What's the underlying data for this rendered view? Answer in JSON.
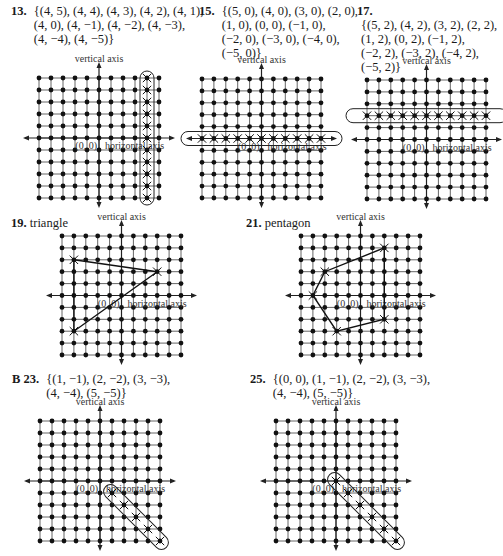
{
  "page": {
    "grid": {
      "min": -5,
      "max": 5,
      "origin_label": "(0, 0)",
      "x_axis_label": "horizontal axis",
      "y_axis_label": "vertical axis"
    },
    "problems": [
      {
        "id": "13",
        "prefix": "",
        "number": "13.",
        "lines": [
          "{(4, 5), (4, 4), (4, 3), (4, 2), (4, 1),",
          "(4, 0), (4, −1), (4, −2), (4, −3),",
          "(4, −4), (4, −5)}"
        ],
        "points": [
          [
            4,
            5
          ],
          [
            4,
            4
          ],
          [
            4,
            3
          ],
          [
            4,
            2
          ],
          [
            4,
            1
          ],
          [
            4,
            0
          ],
          [
            4,
            -1
          ],
          [
            4,
            -2
          ],
          [
            4,
            -3
          ],
          [
            4,
            -4
          ],
          [
            4,
            -5
          ]
        ],
        "shape": "vertical-loop"
      },
      {
        "id": "15",
        "prefix": "",
        "number": "15.",
        "lines": [
          "{(5, 0), (4, 0), (3, 0), (2, 0),",
          "(1, 0), (0, 0), (−1, 0),",
          "(−2, 0), (−3, 0), (−4, 0),",
          "(−5, 0)}"
        ],
        "points": [
          [
            5,
            0
          ],
          [
            4,
            0
          ],
          [
            3,
            0
          ],
          [
            2,
            0
          ],
          [
            1,
            0
          ],
          [
            0,
            0
          ],
          [
            -1,
            0
          ],
          [
            -2,
            0
          ],
          [
            -3,
            0
          ],
          [
            -4,
            0
          ],
          [
            -5,
            0
          ]
        ],
        "shape": "horizontal-loop"
      },
      {
        "id": "17",
        "prefix": "",
        "number": "17.",
        "lines": [
          "{(5, 2), (4, 2), (3, 2), (2, 2),",
          "(1, 2), (0, 2), (−1, 2),",
          "(−2, 2), (−3, 2), (−4, 2),",
          "(−5, 2)}"
        ],
        "points": [
          [
            5,
            2
          ],
          [
            4,
            2
          ],
          [
            3,
            2
          ],
          [
            2,
            2
          ],
          [
            1,
            2
          ],
          [
            0,
            2
          ],
          [
            -1,
            2
          ],
          [
            -2,
            2
          ],
          [
            -3,
            2
          ],
          [
            -4,
            2
          ],
          [
            -5,
            2
          ]
        ],
        "shape": "horizontal-loop"
      },
      {
        "id": "19",
        "prefix": "",
        "number": "19.",
        "title": "triangle",
        "vertices": [
          [
            -4,
            3
          ],
          [
            3,
            2
          ],
          [
            -4,
            -3
          ]
        ],
        "shape": "polygon"
      },
      {
        "id": "21",
        "prefix": "",
        "number": "21.",
        "title": "pentagon",
        "vertices": [
          [
            2,
            4
          ],
          [
            2,
            -2
          ],
          [
            -2,
            -3
          ],
          [
            -4,
            0
          ],
          [
            -3,
            2
          ]
        ],
        "shape": "polygon"
      },
      {
        "id": "23",
        "prefix": "B",
        "number": "23.",
        "lines": [
          "{(1, −1), (2, −2), (3, −3),",
          "(4, −4), (5, −5)}"
        ],
        "points": [
          [
            1,
            -1
          ],
          [
            2,
            -2
          ],
          [
            3,
            -3
          ],
          [
            4,
            -4
          ],
          [
            5,
            -5
          ]
        ],
        "shape": "diagonal-loop"
      },
      {
        "id": "25",
        "prefix": "",
        "number": "25.",
        "lines": [
          "{(0, 0), (1, −1), (2, −2), (3, −3),",
          "(4, −4), (5, −5)}"
        ],
        "points": [
          [
            0,
            0
          ],
          [
            1,
            -1
          ],
          [
            2,
            -2
          ],
          [
            3,
            -3
          ],
          [
            4,
            -4
          ],
          [
            5,
            -5
          ]
        ],
        "shape": "diagonal-loop"
      }
    ]
  }
}
